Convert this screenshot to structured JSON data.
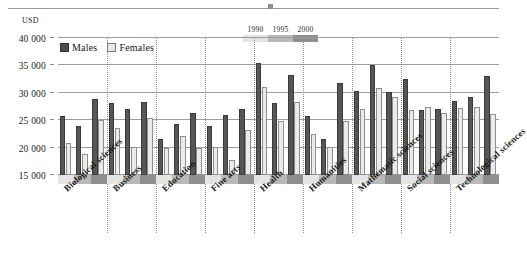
{
  "figure": {
    "unit_label": "USD",
    "top_rule": true
  },
  "gender_legend": {
    "items": [
      {
        "label": "Males",
        "swatch": "dark-filled-square",
        "color": "#4d4d4d"
      },
      {
        "label": "Females",
        "swatch": "light-outlined-square",
        "color": "#e8e8e8"
      }
    ]
  },
  "year_legend": {
    "labels": [
      "1990",
      "1995",
      "2000"
    ],
    "colors": [
      "#e4e4e4",
      "#b9b9b9",
      "#8f8f8f"
    ]
  },
  "chart_data": {
    "type": "bar",
    "title": "",
    "subtitle": "",
    "xlabel": "",
    "ylabel": "USD",
    "ylim": [
      15000,
      40000
    ],
    "yticks": [
      15000,
      20000,
      25000,
      30000,
      35000,
      40000
    ],
    "ytick_labels": [
      "15 000",
      "20 000",
      "25 000",
      "30 000",
      "35 000",
      "40 000"
    ],
    "grid": true,
    "legend_position": "top-left",
    "categories": [
      "Biological sciences",
      "Business",
      "Education",
      "Fine arts",
      "Health",
      "Humanities",
      "Mathematic sciences",
      "Social sciences",
      "Technological sciences"
    ],
    "years": [
      "1990",
      "1995",
      "2000"
    ],
    "series": [
      {
        "name": "Males",
        "color": "#565656",
        "values_by_year": {
          "1990": [
            25700,
            28100,
            21500,
            24000,
            35500,
            25800,
            30400,
            32600,
            28500
          ],
          "1995": [
            24000,
            27100,
            24300,
            25900,
            28100,
            21500,
            35000,
            26800,
            29200
          ],
          "2000": [
            28900,
            28400,
            26400,
            27100,
            33300,
            31800,
            30200,
            27100,
            33000
          ]
        }
      },
      {
        "name": "Females",
        "color": "#ebebeb",
        "values_by_year": {
          "1990": [
            20800,
            23600,
            20000,
            20100,
            31100,
            22500,
            27100,
            26800,
            27200
          ],
          "1995": [
            18900,
            20200,
            22100,
            17800,
            24900,
            20200,
            30900,
            27400,
            27400
          ],
          "2000": [
            25000,
            25400,
            20000,
            23200,
            28300,
            24900,
            29200,
            26400,
            26200
          ]
        }
      }
    ]
  }
}
